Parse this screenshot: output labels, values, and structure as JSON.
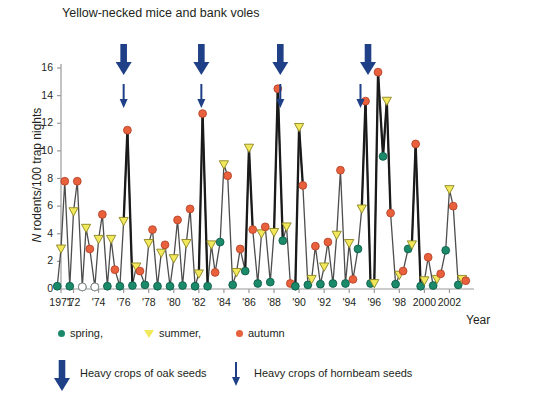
{
  "chart_data": {
    "type": "line",
    "title": "Yellow-necked mice and bank voles",
    "xlabel": "Year",
    "ylabel": "N rodents/100  trap nights",
    "ylabel_italic_prefix": "N",
    "ylim": [
      0,
      16
    ],
    "yticks": [
      0,
      2,
      4,
      6,
      8,
      10,
      12,
      14,
      16
    ],
    "xlim": [
      1971,
      2003
    ],
    "xticks": [
      1971,
      1972,
      1974,
      1976,
      1978,
      1980,
      1982,
      1984,
      1986,
      1988,
      1990,
      1992,
      1994,
      1996,
      1998,
      2000,
      2002
    ],
    "xticklabels": [
      "1971",
      "'72",
      "'74",
      "'76",
      "'78",
      "'80",
      "'82",
      "'84",
      "'86",
      "'88",
      "'90",
      "'92",
      "'94",
      "'96",
      "'98",
      "2000",
      "2002"
    ],
    "grid": false,
    "legend_position": "below-axes",
    "series": [
      {
        "name": "spring",
        "marker": "circle",
        "color": "#1b8a6b",
        "points": [
          {
            "year": 1971,
            "value": 0.2
          },
          {
            "year": 1972,
            "value": 0.2
          },
          {
            "year": 1973,
            "value": 0.15
          },
          {
            "year": 1974,
            "value": 0.15
          },
          {
            "year": 1975,
            "value": 0.2
          },
          {
            "year": 1976,
            "value": 0.2
          },
          {
            "year": 1977,
            "value": 0.25
          },
          {
            "year": 1978,
            "value": 0.3
          },
          {
            "year": 1979,
            "value": 0.2
          },
          {
            "year": 1980,
            "value": 0.2
          },
          {
            "year": 1981,
            "value": 0.25
          },
          {
            "year": 1982,
            "value": 0.2
          },
          {
            "year": 1983,
            "value": 0.2
          },
          {
            "year": 1984,
            "value": 3.4
          },
          {
            "year": 1985,
            "value": 0.3
          },
          {
            "year": 1986,
            "value": 1.3
          },
          {
            "year": 1987,
            "value": 0.4
          },
          {
            "year": 1988,
            "value": 0.5
          },
          {
            "year": 1989,
            "value": 3.5
          },
          {
            "year": 1990,
            "value": 0.2
          },
          {
            "year": 1991,
            "value": 0.3
          },
          {
            "year": 1992,
            "value": 0.35
          },
          {
            "year": 1993,
            "value": 0.4
          },
          {
            "year": 1994,
            "value": 0.4
          },
          {
            "year": 1995,
            "value": 2.9
          },
          {
            "year": 1996,
            "value": 0.4
          },
          {
            "year": 1997,
            "value": 9.6
          },
          {
            "year": 1998,
            "value": 0.35
          },
          {
            "year": 1999,
            "value": 2.9
          },
          {
            "year": 2000,
            "value": 0.2
          },
          {
            "year": 2001,
            "value": 0.25
          },
          {
            "year": 2002,
            "value": 2.8
          },
          {
            "year": 2003,
            "value": 0.3
          }
        ]
      },
      {
        "name": "summer",
        "marker": "triangle-down",
        "color": "#f2e85c",
        "points": [
          {
            "year": 1971,
            "value": 2.9
          },
          {
            "year": 1972,
            "value": 5.6
          },
          {
            "year": 1973,
            "value": 4.4
          },
          {
            "year": 1974,
            "value": 3.6
          },
          {
            "year": 1975,
            "value": 3.6
          },
          {
            "year": 1976,
            "value": 4.9
          },
          {
            "year": 1977,
            "value": 1.6
          },
          {
            "year": 1978,
            "value": 3.3
          },
          {
            "year": 1979,
            "value": 2.6
          },
          {
            "year": 1980,
            "value": 2.2
          },
          {
            "year": 1981,
            "value": 3.3
          },
          {
            "year": 1982,
            "value": 1.1
          },
          {
            "year": 1983,
            "value": 3.2
          },
          {
            "year": 1984,
            "value": 9.0
          },
          {
            "year": 1985,
            "value": 1.2
          },
          {
            "year": 1986,
            "value": 10.2
          },
          {
            "year": 1987,
            "value": 4.0
          },
          {
            "year": 1988,
            "value": 4.1
          },
          {
            "year": 1989,
            "value": 4.5
          },
          {
            "year": 1990,
            "value": 11.7
          },
          {
            "year": 1991,
            "value": 0.7
          },
          {
            "year": 1992,
            "value": 1.6
          },
          {
            "year": 1993,
            "value": 3.9
          },
          {
            "year": 1994,
            "value": 3.3
          },
          {
            "year": 1995,
            "value": 5.8
          },
          {
            "year": 1996,
            "value": 0.4
          },
          {
            "year": 1997,
            "value": 13.6
          },
          {
            "year": 1998,
            "value": 1.0
          },
          {
            "year": 1999,
            "value": 3.2
          },
          {
            "year": 2000,
            "value": 0.6
          },
          {
            "year": 2001,
            "value": 0.7
          },
          {
            "year": 2002,
            "value": 7.2
          },
          {
            "year": 2003,
            "value": 0.7
          }
        ]
      },
      {
        "name": "autumn",
        "marker": "circle",
        "color": "#e8603c",
        "points": [
          {
            "year": 1971,
            "value": 7.8
          },
          {
            "year": 1972,
            "value": 7.8
          },
          {
            "year": 1973,
            "value": 2.9
          },
          {
            "year": 1974,
            "value": 5.4
          },
          {
            "year": 1975,
            "value": 1.4
          },
          {
            "year": 1976,
            "value": 11.5
          },
          {
            "year": 1977,
            "value": 1.3
          },
          {
            "year": 1978,
            "value": 4.3
          },
          {
            "year": 1979,
            "value": 3.2
          },
          {
            "year": 1980,
            "value": 5.0
          },
          {
            "year": 1981,
            "value": 5.8
          },
          {
            "year": 1982,
            "value": 12.7
          },
          {
            "year": 1983,
            "value": 1.2
          },
          {
            "year": 1984,
            "value": 8.2
          },
          {
            "year": 1985,
            "value": 2.9
          },
          {
            "year": 1986,
            "value": 4.3
          },
          {
            "year": 1987,
            "value": 4.5
          },
          {
            "year": 1988,
            "value": 14.5
          },
          {
            "year": 1989,
            "value": 0.4
          },
          {
            "year": 1990,
            "value": 7.5
          },
          {
            "year": 1991,
            "value": 3.1
          },
          {
            "year": 1992,
            "value": 3.4
          },
          {
            "year": 1993,
            "value": 8.6
          },
          {
            "year": 1994,
            "value": 0.7
          },
          {
            "year": 1995,
            "value": 13.6
          },
          {
            "year": 1996,
            "value": 15.7
          },
          {
            "year": 1997,
            "value": 5.5
          },
          {
            "year": 1998,
            "value": 1.3
          },
          {
            "year": 1999,
            "value": 10.5
          },
          {
            "year": 2000,
            "value": 2.3
          },
          {
            "year": 2001,
            "value": 1.1
          },
          {
            "year": 2002,
            "value": 6.0
          },
          {
            "year": 2003,
            "value": 0.6
          }
        ]
      }
    ],
    "annotations": {
      "oak_arrows": [
        {
          "year": 1976.0,
          "label": "heavy oak crop"
        },
        {
          "year": 1982.2,
          "label": "heavy oak crop"
        },
        {
          "year": 1988.5,
          "label": "heavy oak crop"
        },
        {
          "year": 1995.5,
          "label": "heavy oak crop"
        }
      ],
      "hornbeam_arrows": [
        {
          "year": 1976.0,
          "label": "heavy hornbeam crop"
        },
        {
          "year": 1982.2,
          "label": "heavy hornbeam crop"
        },
        {
          "year": 1988.5,
          "label": "heavy hornbeam crop"
        },
        {
          "year": 1994.9,
          "label": "heavy hornbeam crop"
        }
      ]
    }
  },
  "legend": {
    "series_items": [
      {
        "label": "spring,",
        "marker": "circle",
        "color": "#1b8a6b"
      },
      {
        "label": "summer,",
        "marker": "triangle-down",
        "color": "#f2e85c"
      },
      {
        "label": "autumn",
        "marker": "circle",
        "color": "#e8603c"
      }
    ],
    "annotation_items": [
      {
        "label": "Heavy crops of oak seeds",
        "icon": "thick-down-arrow-icon",
        "color": "#1f3f87"
      },
      {
        "label": "Heavy crops of hornbeam seeds",
        "icon": "thin-down-arrow-icon",
        "color": "#1f3f87"
      }
    ]
  },
  "colors": {
    "spring": "#1b8a6b",
    "summer": "#f2e85c",
    "autumn": "#e8603c",
    "arrow": "#1f3f87",
    "line": "#4d4d4d",
    "axis": "#9a9a9a",
    "text": "#231f20"
  }
}
